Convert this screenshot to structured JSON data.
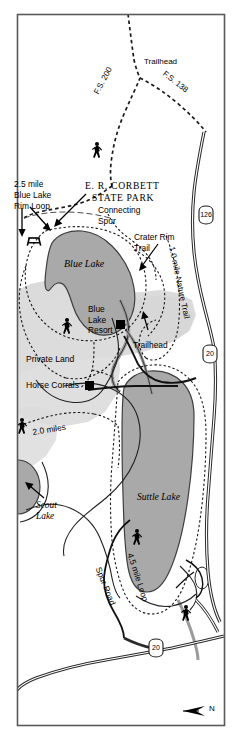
{
  "map": {
    "title": "E.R. Corbett State Park / Blue Lake & Suttle Lake Recreation Map",
    "north_label": "N",
    "colors": {
      "water": "#a9a9a9",
      "water_outline": "#4a4a4a",
      "park_shade": "#d8d8d8",
      "private_shade": "#dcdcdc",
      "road": "#000000",
      "trail_dash": "#1a1a1a",
      "border": "#555555",
      "background": "#ffffff",
      "marker": "#000000"
    },
    "border": {
      "name": "map-frame"
    }
  },
  "park": {
    "name_line1": "E. R. CORBETT",
    "name_line2": "STATE PARK"
  },
  "water_features": [
    {
      "id": "blue-lake",
      "label": "Blue Lake"
    },
    {
      "id": "suttle-lake",
      "label": "Suttle Lake"
    },
    {
      "id": "scout-lake",
      "label": "Scout\nLake"
    }
  ],
  "trails": [
    {
      "id": "blue-lake-rim-loop",
      "label": "2.5 mile\nBlue Lake\nRim Loop",
      "distance": "2.5 mile"
    },
    {
      "id": "connecting-spur",
      "label": "Connecting\nSpur"
    },
    {
      "id": "crater-rim-trail",
      "label": "Crater Rim\nTrail"
    },
    {
      "id": "nature-trail",
      "label": "1.0 mile Nature Trail",
      "distance": "1.0 mile"
    },
    {
      "id": "four-five-mile-loop",
      "label": "4.5 mile Loop",
      "distance": "4.5 mile"
    },
    {
      "id": "two-mile-connector",
      "label": "2.0 miles",
      "distance": "2.0 miles"
    }
  ],
  "roads": [
    {
      "id": "fs-200",
      "label": "F.S. 200"
    },
    {
      "id": "fs-138",
      "label": "F.S. 138"
    },
    {
      "id": "spur-road",
      "label": "Spur Road"
    }
  ],
  "highway_shields": [
    {
      "id": "or-126",
      "number": "126",
      "type": "state"
    },
    {
      "id": "us-20-north",
      "number": "20",
      "type": "us"
    },
    {
      "id": "us-20-south",
      "number": "20",
      "type": "us"
    }
  ],
  "points_of_interest": [
    {
      "id": "trailhead-north",
      "label": "Trailhead"
    },
    {
      "id": "trailhead-resort",
      "label": "Trailhead"
    },
    {
      "id": "blue-lake-resort",
      "label": "Blue\nLake\nResort"
    },
    {
      "id": "horse-corrals",
      "label": "Horse Corrals"
    }
  ],
  "land_areas": [
    {
      "id": "private-land",
      "label": "Private Land"
    }
  ],
  "icons": [
    {
      "id": "picnic-table-icon",
      "glyph": "picnic-table"
    },
    {
      "id": "hiker-icon-fs200",
      "glyph": "hiker"
    },
    {
      "id": "hiker-icon-resort",
      "glyph": "hiker"
    },
    {
      "id": "hiker-icon-west",
      "glyph": "hiker"
    },
    {
      "id": "hiker-icon-suttle",
      "glyph": "hiker"
    },
    {
      "id": "hiker-icon-southeast",
      "glyph": "hiker"
    },
    {
      "id": "north-arrow-icon",
      "glyph": "north-arrow"
    }
  ]
}
